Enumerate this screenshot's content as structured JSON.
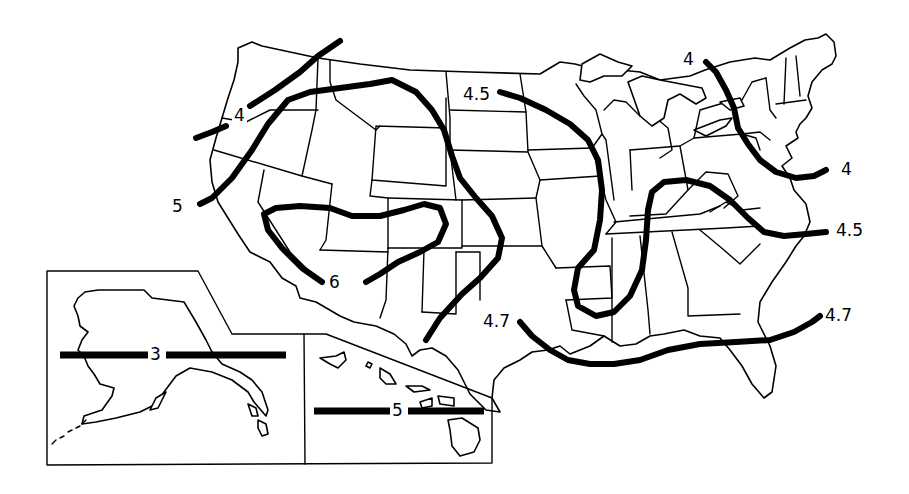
{
  "map": {
    "title": "",
    "region": "United States with Alaska and Hawaii insets",
    "colors": {
      "line": "#000000",
      "background": "#ffffff"
    },
    "isolines": [
      {
        "id": "pnw-4",
        "value": "4"
      },
      {
        "id": "west-5",
        "value": "5"
      },
      {
        "id": "southwest-6",
        "value": "6"
      },
      {
        "id": "plains-4-5",
        "value": "4.5"
      },
      {
        "id": "gulf-4-7-west",
        "value": "4.7"
      },
      {
        "id": "gulf-4-7-east",
        "value": "4.7"
      },
      {
        "id": "northeast-4",
        "value": "4"
      },
      {
        "id": "northeast-4-end",
        "value": "4"
      },
      {
        "id": "east-4-5",
        "value": "4.5"
      },
      {
        "id": "alaska-3",
        "value": "3"
      },
      {
        "id": "hawaii-5",
        "value": "5"
      }
    ],
    "labels": {
      "pnw": "4",
      "west": "5",
      "southwest": "6",
      "plains": "4.5",
      "gulf_west": "4.7",
      "gulf_east": "4.7",
      "northeast_start": "4",
      "northeast_end": "4",
      "east": "4.5",
      "alaska": "3",
      "hawaii": "5"
    },
    "insets": [
      {
        "name": "Alaska"
      },
      {
        "name": "Hawaii"
      }
    ]
  }
}
